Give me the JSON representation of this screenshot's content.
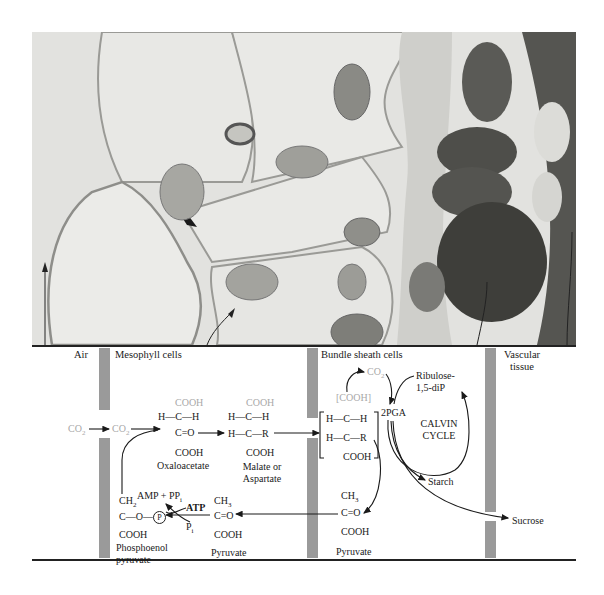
{
  "figure": {
    "micrograph": {
      "description": "electron micrograph of C4 leaf cross-section"
    },
    "region_labels": {
      "air": "Air",
      "mesophyll": "Mesophyll cells",
      "bundle_sheath": "Bundle sheath cells",
      "vascular_line1": "Vascular",
      "vascular_line2": "tissue"
    },
    "pathway": {
      "co2_air": "CO",
      "co2_mesophyll": "CO",
      "co2_bundle": "CO",
      "co2_sub": "2",
      "oxaloacetate": {
        "top": "COOH",
        "row1": "H—C—H",
        "row2": "C=O",
        "bottom": "COOH",
        "name": "Oxaloacetate"
      },
      "malate": {
        "top": "COOH",
        "row1": "H—C—H",
        "row2": "H—C—R",
        "bottom": "COOH",
        "name_line1": "Malate or",
        "name_line2": "Aspartate"
      },
      "bundle_acid": {
        "top": "[COOH]",
        "row1": "H—C—H",
        "row2": "H—C—R",
        "bottom": "COOH"
      },
      "pga": "2PGA",
      "rubp_line1": "Ribulose-",
      "rubp_line2": "1,5-diP",
      "calvin_line1": "CALVIN",
      "calvin_line2": "CYCLE",
      "starch": "Starch",
      "sucrose": "Sucrose",
      "pyruvate_bundle": {
        "top": "CH",
        "top_sub": "3",
        "mid": "C=O",
        "bottom": "COOH",
        "name": "Pyruvate"
      },
      "pyruvate_meso": {
        "top": "CH",
        "top_sub": "3",
        "mid": "C=O",
        "bottom": "COOH",
        "name": "Pyruvate"
      },
      "pep": {
        "top": "CH",
        "top_sub": "2",
        "mid": "C—O—",
        "phosphate": "P",
        "bottom": "COOH",
        "name_line1": "Phosphoenol",
        "name_line2": "pyruvate"
      },
      "amp_ppi": "AMP + PP",
      "amp_sub": "i",
      "atp": "ATP",
      "pi": "P",
      "pi_sub": "i"
    }
  }
}
